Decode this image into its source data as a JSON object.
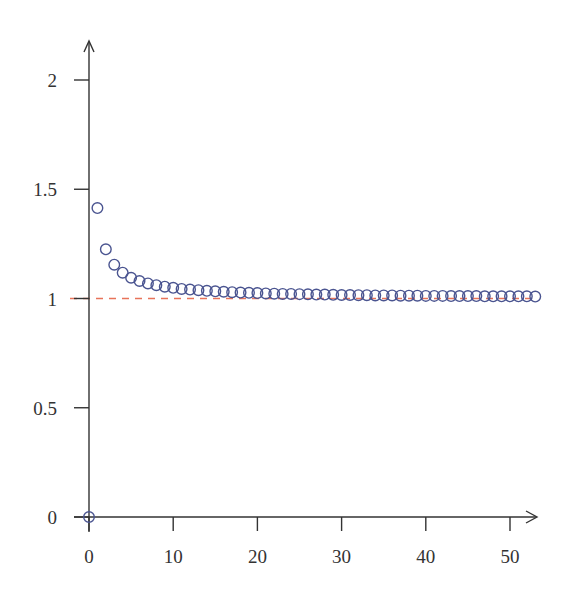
{
  "chart_data": {
    "type": "scatter",
    "title": "",
    "xlabel": "",
    "ylabel": "",
    "xlim": [
      0,
      53
    ],
    "ylim": [
      0,
      2.2
    ],
    "grid": false,
    "legend": null,
    "x_ticks": [
      "0",
      "10",
      "20",
      "30",
      "40",
      "50"
    ],
    "y_ticks": [
      "0",
      "0.5",
      "1",
      "1.5",
      "2"
    ],
    "series": [
      {
        "name": "sequence",
        "marker": "open-circle",
        "color": "#4a5490",
        "x": [
          0,
          1,
          2,
          3,
          4,
          5,
          6,
          7,
          8,
          9,
          10,
          11,
          12,
          13,
          14,
          15,
          16,
          17,
          18,
          19,
          20,
          21,
          22,
          23,
          24,
          25,
          26,
          27,
          28,
          29,
          30,
          31,
          32,
          33,
          34,
          35,
          36,
          37,
          38,
          39,
          40,
          41,
          42,
          43,
          44,
          45,
          46,
          47,
          48,
          49,
          50,
          51,
          52,
          53
        ],
        "y": [
          0,
          1.414,
          1.225,
          1.155,
          1.118,
          1.095,
          1.08,
          1.069,
          1.061,
          1.054,
          1.049,
          1.044,
          1.041,
          1.038,
          1.035,
          1.033,
          1.031,
          1.029,
          1.027,
          1.026,
          1.025,
          1.023,
          1.022,
          1.021,
          1.021,
          1.02,
          1.019,
          1.018,
          1.018,
          1.017,
          1.016,
          1.016,
          1.015,
          1.015,
          1.014,
          1.014,
          1.014,
          1.013,
          1.013,
          1.013,
          1.012,
          1.012,
          1.012,
          1.011,
          1.011,
          1.011,
          1.011,
          1.01,
          1.01,
          1.01,
          1.01,
          1.01,
          1.01,
          1.009
        ]
      }
    ],
    "reference_lines": [
      {
        "orientation": "horizontal",
        "y": 1,
        "style": "dashed",
        "color": "#e8735a"
      }
    ]
  },
  "colors": {
    "axis": "#333333",
    "marker": "#4a5490",
    "reference": "#e8735a"
  }
}
